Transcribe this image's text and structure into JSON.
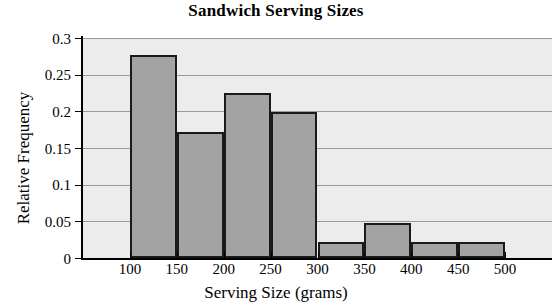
{
  "chart_data": {
    "type": "bar",
    "title": "Sandwich Serving Sizes",
    "xlabel": "Serving Size (grams)",
    "ylabel": "Relative Frequency",
    "grid": true,
    "legend": "none",
    "xlim": [
      50,
      550
    ],
    "ylim": [
      0,
      0.3
    ],
    "bin_width": 50,
    "bin_edges": [
      100,
      150,
      200,
      250,
      300,
      350,
      400,
      450,
      500
    ],
    "categories": [
      "100-150",
      "150-200",
      "200-250",
      "250-300",
      "300-350",
      "350-400",
      "400-450",
      "450-500"
    ],
    "values": [
      0.277,
      0.172,
      0.225,
      0.199,
      0.022,
      0.048,
      0.022,
      0.022
    ],
    "xticks": [
      100,
      150,
      200,
      250,
      300,
      350,
      400,
      450,
      500
    ],
    "xtick_labels": [
      "100",
      "150",
      "200",
      "250",
      "300",
      "350",
      "400",
      "450",
      "500"
    ],
    "yticks": [
      0,
      0.05,
      0.1,
      0.15,
      0.2,
      0.25,
      0.3
    ],
    "ytick_labels": [
      "0",
      "0.05",
      "0.1",
      "0.15",
      "0.2",
      "0.25",
      "0.3"
    ],
    "colors": {
      "bar_fill": "#a3a3a3",
      "bar_edge": "#1a1a1a",
      "plot_background": "#ececec",
      "gridline": "#9a9a9a",
      "axis": "#000000",
      "text": "#000000"
    }
  }
}
